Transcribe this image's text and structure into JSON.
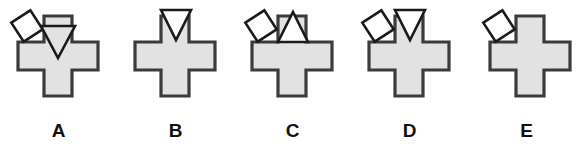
{
  "canvas": {
    "width": 585,
    "height": 158,
    "background": "#ffffff"
  },
  "style": {
    "cross_fill": "#e2e2e2",
    "cross_stroke": "#3b3b3b",
    "shape_fill": "#ffffff",
    "shape_stroke": "#1a1a1a",
    "label_color": "#111111",
    "stroke_width_cross": 3.2,
    "stroke_width_shape": 2.6
  },
  "question": {
    "type": "multiple-choice-figure-row",
    "option_count": 5
  },
  "options": [
    {
      "id": "A",
      "label": "A",
      "x": 0,
      "cross": {
        "name": "cross-shape",
        "cx": 58,
        "cy": 56,
        "arm_half_width": 14,
        "half_span": 40
      },
      "attachments": [
        {
          "name": "diamond-shape",
          "kind": "diamond",
          "position": "upper-left",
          "cx": 27,
          "cy": 26,
          "radius": 16,
          "rotation": 12,
          "fill": "#ffffff"
        },
        {
          "name": "triangle-down-shape",
          "kind": "triangle",
          "direction": "down",
          "position": "top-arm-overlap",
          "cx": 58,
          "cy": 42,
          "width": 34,
          "height": 32,
          "fill": "#e2e2e2"
        }
      ]
    },
    {
      "id": "B",
      "label": "B",
      "x": 117,
      "cross": {
        "name": "cross-shape",
        "cx": 58,
        "cy": 56,
        "arm_half_width": 14,
        "half_span": 40
      },
      "attachments": [
        {
          "name": "triangle-down-shape",
          "kind": "triangle",
          "direction": "down",
          "position": "upper-right",
          "cx": 59,
          "cy": 25,
          "width": 30,
          "height": 30,
          "fill": "#ffffff"
        }
      ]
    },
    {
      "id": "C",
      "label": "C",
      "x": 234,
      "cross": {
        "name": "cross-shape",
        "cx": 58,
        "cy": 56,
        "arm_half_width": 14,
        "half_span": 40
      },
      "attachments": [
        {
          "name": "diamond-shape",
          "kind": "diamond",
          "position": "upper-left",
          "cx": 27,
          "cy": 26,
          "radius": 16,
          "rotation": 12,
          "fill": "#ffffff"
        },
        {
          "name": "triangle-up-shape",
          "kind": "triangle",
          "direction": "up",
          "position": "upper-right",
          "cx": 59,
          "cy": 27,
          "width": 30,
          "height": 30,
          "fill": "#ffffff"
        }
      ]
    },
    {
      "id": "D",
      "label": "D",
      "x": 351,
      "cross": {
        "name": "cross-shape",
        "cx": 58,
        "cy": 56,
        "arm_half_width": 14,
        "half_span": 40
      },
      "attachments": [
        {
          "name": "diamond-shape",
          "kind": "diamond",
          "position": "upper-left",
          "cx": 27,
          "cy": 26,
          "radius": 16,
          "rotation": 12,
          "fill": "#ffffff"
        },
        {
          "name": "triangle-down-shape",
          "kind": "triangle",
          "direction": "down",
          "position": "upper-right",
          "cx": 59,
          "cy": 25,
          "width": 30,
          "height": 30,
          "fill": "#ffffff"
        }
      ]
    },
    {
      "id": "E",
      "label": "E",
      "x": 468,
      "cross": {
        "name": "cross-shape",
        "cx": 62,
        "cy": 56,
        "arm_half_width": 14,
        "half_span": 40
      },
      "attachments": [
        {
          "name": "diamond-shape",
          "kind": "diamond",
          "position": "upper-left",
          "cx": 31,
          "cy": 26,
          "radius": 16,
          "rotation": 12,
          "fill": "#ffffff"
        }
      ]
    }
  ]
}
